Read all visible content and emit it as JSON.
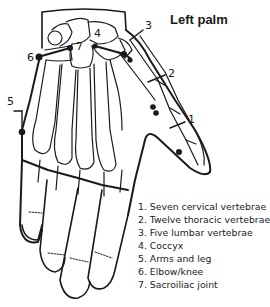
{
  "title": "Left palm",
  "labels": {
    "l1": "1",
    "l2": "2",
    "l3": "3",
    "l4": "4",
    "l5": "5",
    "l6": "6",
    "l7": "7"
  },
  "legend": [
    "1. Seven cervical vertebrae",
    "2. Twelve thoracic vertebrae",
    "3. Five lumbar vertebrae",
    "4. Coccyx",
    "5. Arms and leg",
    "6. Elbow/knee",
    "7. Sacroiliac joint"
  ],
  "colors": {
    "line": "#1a1a1a",
    "background": "#ffffff"
  }
}
